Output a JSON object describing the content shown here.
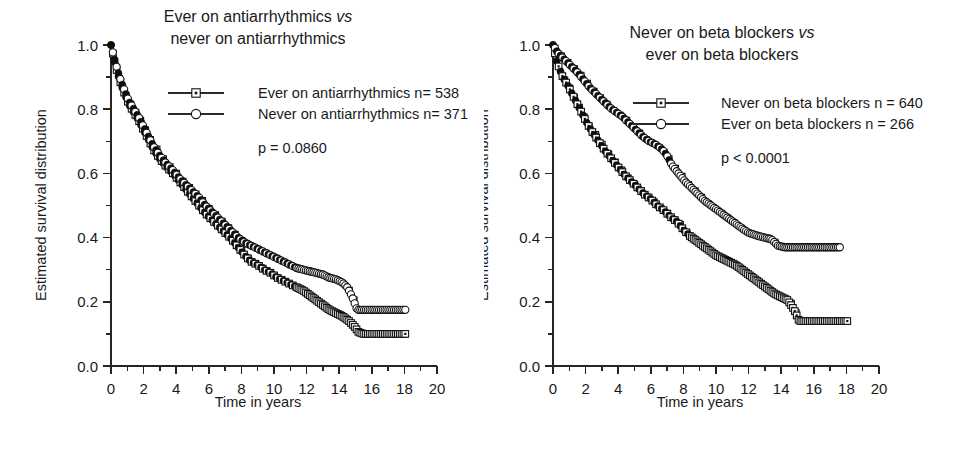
{
  "figure": {
    "background": "#ffffff",
    "ink_color": "#111111",
    "panel_count": 2
  },
  "chart_data": [
    {
      "type": "line",
      "subtype": "kaplan-meier-survival",
      "panel": "left",
      "title": "Ever on antiarrhythmics vs never on antiarrhythmics",
      "title_lines": [
        {
          "pre": "Ever on antiarrhythmics ",
          "vs": "vs",
          "post": ""
        },
        {
          "pre": "never on antiarrhythmics",
          "vs": "",
          "post": ""
        }
      ],
      "xlabel": "Time in years",
      "ylabel": "Estimated survival distribution",
      "xlim": [
        0,
        20
      ],
      "ylim": [
        0.0,
        1.0
      ],
      "xticks": [
        0,
        2,
        4,
        6,
        8,
        10,
        12,
        14,
        16,
        18,
        20
      ],
      "xticklabels": [
        "0",
        "2",
        "4",
        "6",
        "8",
        "10",
        "12",
        "14",
        "16",
        "18",
        "20"
      ],
      "xminor_step": 1,
      "yticks": [
        0.0,
        0.2,
        0.4,
        0.6,
        0.8,
        1.0
      ],
      "yticklabels": [
        "0.0",
        "0.2",
        "0.4",
        "0.6",
        "0.8",
        "1.0"
      ],
      "yminor_step": 0.1,
      "grid": false,
      "legend_position": "upper-right-inside",
      "annotation": "p = 0.0860",
      "pvalue_label": "p = 0.0860",
      "pvalue_operator": "=",
      "pvalue": 0.086,
      "series": [
        {
          "name": "Ever on antiarrhythmics n= 538",
          "label": "Ever on antiarrhythmics n= 538",
          "marker": "open-square-dot",
          "n": 538,
          "x": [
            0,
            0.15,
            0.3,
            0.5,
            0.7,
            0.9,
            1.1,
            1.4,
            1.7,
            2.0,
            2.3,
            2.6,
            3.0,
            3.4,
            3.8,
            4.2,
            4.6,
            5.0,
            5.4,
            5.8,
            6.2,
            6.6,
            7.0,
            7.4,
            7.8,
            8.2,
            8.6,
            9.0,
            9.4,
            9.8,
            10.2,
            10.6,
            11.0,
            11.4,
            11.8,
            12.2,
            12.6,
            13.0,
            13.4,
            13.8,
            14.2,
            14.6,
            14.9,
            15.2,
            15.5,
            15.9,
            18.1
          ],
          "y": [
            1.0,
            0.965,
            0.93,
            0.895,
            0.865,
            0.84,
            0.815,
            0.79,
            0.765,
            0.735,
            0.705,
            0.675,
            0.645,
            0.62,
            0.6,
            0.575,
            0.55,
            0.525,
            0.5,
            0.475,
            0.455,
            0.435,
            0.415,
            0.395,
            0.37,
            0.345,
            0.325,
            0.315,
            0.3,
            0.29,
            0.275,
            0.265,
            0.255,
            0.245,
            0.235,
            0.22,
            0.205,
            0.19,
            0.175,
            0.165,
            0.155,
            0.14,
            0.125,
            0.105,
            0.1,
            0.1,
            0.1
          ]
        },
        {
          "name": "Never on antiarrhythmics n= 371",
          "label": "Never on antiarrhythmics n= 371",
          "marker": "open-circle",
          "n": 371,
          "x": [
            0,
            0.15,
            0.3,
            0.5,
            0.7,
            0.9,
            1.1,
            1.4,
            1.7,
            2.0,
            2.3,
            2.6,
            3.0,
            3.4,
            3.8,
            4.2,
            4.6,
            5.0,
            5.4,
            5.8,
            6.2,
            6.6,
            7.0,
            7.4,
            7.8,
            8.2,
            8.6,
            9.0,
            9.4,
            9.8,
            10.2,
            10.6,
            11.0,
            11.4,
            11.8,
            12.2,
            12.6,
            13.0,
            13.4,
            13.8,
            14.2,
            14.5,
            14.8,
            15.1,
            15.5,
            16.0,
            16.6,
            17.2,
            18.1
          ],
          "y": [
            1.0,
            0.97,
            0.94,
            0.905,
            0.875,
            0.85,
            0.825,
            0.8,
            0.775,
            0.745,
            0.715,
            0.685,
            0.655,
            0.63,
            0.61,
            0.585,
            0.565,
            0.545,
            0.525,
            0.5,
            0.48,
            0.46,
            0.44,
            0.42,
            0.4,
            0.385,
            0.375,
            0.365,
            0.355,
            0.345,
            0.335,
            0.325,
            0.315,
            0.305,
            0.3,
            0.295,
            0.29,
            0.285,
            0.275,
            0.27,
            0.26,
            0.245,
            0.215,
            0.175,
            0.175,
            0.175,
            0.175,
            0.175,
            0.175
          ]
        }
      ]
    },
    {
      "type": "line",
      "subtype": "kaplan-meier-survival",
      "panel": "right",
      "title": "Never on beta blockers vs ever on beta blockers",
      "title_lines": [
        {
          "pre": "Never on beta blockers ",
          "vs": "vs",
          "post": ""
        },
        {
          "pre": "ever on beta blockers",
          "vs": "",
          "post": ""
        }
      ],
      "xlabel": "Time in years",
      "ylabel": "Estimated survival distribution",
      "xlim": [
        0,
        20
      ],
      "ylim": [
        0.0,
        1.0
      ],
      "xticks": [
        0,
        2,
        4,
        6,
        8,
        10,
        12,
        14,
        16,
        18,
        20
      ],
      "xticklabels": [
        "0",
        "2",
        "4",
        "6",
        "8",
        "10",
        "12",
        "14",
        "16",
        "18",
        "20"
      ],
      "xminor_step": 1,
      "yticks": [
        0.0,
        0.2,
        0.4,
        0.6,
        0.8,
        1.0
      ],
      "yticklabels": [
        "0.0",
        "0.2",
        "0.4",
        "0.6",
        "0.8",
        "1.0"
      ],
      "yminor_step": 0.1,
      "grid": false,
      "legend_position": "upper-right-inside",
      "annotation": "p < 0.0001",
      "pvalue_label": "p < 0.0001",
      "pvalue_operator": "<",
      "pvalue": 0.0001,
      "series": [
        {
          "name": "Never on beta blockers n = 640",
          "label": "Never on beta blockers n = 640",
          "marker": "open-square-dot",
          "n": 640,
          "x": [
            0,
            0.2,
            0.4,
            0.6,
            0.9,
            1.2,
            1.5,
            1.8,
            2.1,
            2.4,
            2.8,
            3.2,
            3.6,
            4.0,
            4.4,
            4.8,
            5.2,
            5.6,
            6.0,
            6.4,
            6.8,
            7.2,
            7.6,
            8.0,
            8.4,
            8.8,
            9.2,
            9.6,
            10.0,
            10.4,
            10.8,
            11.2,
            11.6,
            12.0,
            12.4,
            12.8,
            13.2,
            13.6,
            14.0,
            14.4,
            14.8,
            15.1,
            15.5,
            16.0,
            16.4,
            17.5,
            18.1
          ],
          "y": [
            1.0,
            0.955,
            0.925,
            0.9,
            0.875,
            0.845,
            0.815,
            0.785,
            0.755,
            0.73,
            0.7,
            0.67,
            0.645,
            0.62,
            0.595,
            0.575,
            0.555,
            0.535,
            0.52,
            0.5,
            0.485,
            0.465,
            0.45,
            0.425,
            0.405,
            0.39,
            0.375,
            0.36,
            0.345,
            0.335,
            0.325,
            0.315,
            0.3,
            0.285,
            0.27,
            0.255,
            0.24,
            0.225,
            0.215,
            0.205,
            0.175,
            0.14,
            0.14,
            0.14,
            0.14,
            0.14,
            0.14
          ]
        },
        {
          "name": "Ever on beta blockers  n = 266",
          "label": "Ever on beta blockers  n = 266",
          "marker": "open-circle",
          "n": 266,
          "x": [
            0,
            0.3,
            0.7,
            1.1,
            1.5,
            1.9,
            2.3,
            2.7,
            3.1,
            3.5,
            3.9,
            4.3,
            4.7,
            5.1,
            5.5,
            5.9,
            6.3,
            6.7,
            7.0,
            7.3,
            7.7,
            8.1,
            8.5,
            8.9,
            9.3,
            9.7,
            10.1,
            10.5,
            10.9,
            11.3,
            11.7,
            12.0,
            12.3,
            12.6,
            13.0,
            13.4,
            13.8,
            14.2,
            14.8,
            15.4,
            16.2,
            17.0,
            17.7
          ],
          "y": [
            1.0,
            0.975,
            0.955,
            0.935,
            0.915,
            0.89,
            0.865,
            0.845,
            0.825,
            0.805,
            0.79,
            0.775,
            0.755,
            0.735,
            0.715,
            0.7,
            0.69,
            0.675,
            0.655,
            0.625,
            0.6,
            0.575,
            0.555,
            0.535,
            0.515,
            0.5,
            0.485,
            0.47,
            0.455,
            0.44,
            0.425,
            0.415,
            0.41,
            0.405,
            0.4,
            0.395,
            0.375,
            0.37,
            0.37,
            0.37,
            0.37,
            0.37,
            0.37
          ]
        }
      ]
    }
  ]
}
